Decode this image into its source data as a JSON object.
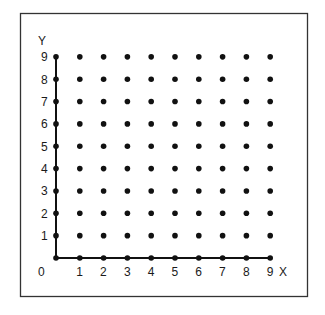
{
  "diagram": {
    "axis_labels": {
      "x": "X",
      "y": "Y",
      "origin": "0"
    },
    "x_ticks": [
      "1",
      "2",
      "3",
      "4",
      "5",
      "6",
      "7",
      "8",
      "9"
    ],
    "y_ticks": [
      "1",
      "2",
      "3",
      "4",
      "5",
      "6",
      "7",
      "8",
      "9"
    ],
    "grid": {
      "x_min": 0,
      "x_max": 9,
      "y_min": 0,
      "y_max": 9,
      "step": 1
    },
    "colors": {
      "ink": "#111111",
      "frame": "#333333",
      "background": "#ffffff"
    }
  },
  "chart_data": {
    "type": "scatter",
    "title": "",
    "xlabel": "X",
    "ylabel": "Y",
    "xlim": [
      0,
      9
    ],
    "ylim": [
      0,
      9
    ],
    "grid": false,
    "x_ticks": [
      0,
      1,
      2,
      3,
      4,
      5,
      6,
      7,
      8,
      9
    ],
    "y_ticks": [
      0,
      1,
      2,
      3,
      4,
      5,
      6,
      7,
      8,
      9
    ],
    "points_rule": "all integer pairs (x,y), x in 0..9, y in 0..9",
    "point_count": 100
  }
}
